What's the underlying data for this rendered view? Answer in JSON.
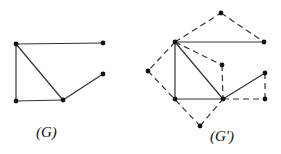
{
  "graphs": [
    {
      "id": "G",
      "label": "(G)",
      "label_pos": [
        48,
        134
      ],
      "nodes": [
        {
          "id": "A",
          "x": 16,
          "y": 44
        },
        {
          "id": "B",
          "x": 103,
          "y": 43
        },
        {
          "id": "C",
          "x": 103,
          "y": 74
        },
        {
          "id": "D",
          "x": 16,
          "y": 101
        },
        {
          "id": "E",
          "x": 63,
          "y": 100
        }
      ],
      "edges": [
        {
          "from": "A",
          "to": "B",
          "style": "solid"
        },
        {
          "from": "A",
          "to": "D",
          "style": "solid"
        },
        {
          "from": "A",
          "to": "E",
          "style": "solid"
        },
        {
          "from": "D",
          "to": "E",
          "style": "solid"
        },
        {
          "from": "E",
          "to": "C",
          "style": "solid"
        }
      ]
    },
    {
      "id": "G'",
      "label": "(G')",
      "label_pos": [
        222,
        138
      ],
      "nodes": [
        {
          "id": "P",
          "x": 221,
          "y": 13
        },
        {
          "id": "A",
          "x": 175,
          "y": 42
        },
        {
          "id": "B",
          "x": 264,
          "y": 42
        },
        {
          "id": "Q",
          "x": 222,
          "y": 65
        },
        {
          "id": "R",
          "x": 148,
          "y": 71
        },
        {
          "id": "C",
          "x": 265,
          "y": 73
        },
        {
          "id": "D",
          "x": 175,
          "y": 99
        },
        {
          "id": "E",
          "x": 223,
          "y": 99
        },
        {
          "id": "S",
          "x": 265,
          "y": 99
        },
        {
          "id": "T",
          "x": 200,
          "y": 126
        }
      ],
      "edges": [
        {
          "from": "A",
          "to": "B",
          "style": "solid"
        },
        {
          "from": "A",
          "to": "D",
          "style": "solid"
        },
        {
          "from": "A",
          "to": "E",
          "style": "solid"
        },
        {
          "from": "D",
          "to": "E",
          "style": "solid"
        },
        {
          "from": "E",
          "to": "C",
          "style": "solid"
        },
        {
          "from": "A",
          "to": "P",
          "style": "dashed"
        },
        {
          "from": "P",
          "to": "B",
          "style": "dashed"
        },
        {
          "from": "A",
          "to": "Q",
          "style": "dashed"
        },
        {
          "from": "Q",
          "to": "E",
          "style": "dashed"
        },
        {
          "from": "A",
          "to": "R",
          "style": "dashed"
        },
        {
          "from": "R",
          "to": "T",
          "style": "dashed"
        },
        {
          "from": "T",
          "to": "E",
          "style": "dashed"
        },
        {
          "from": "C",
          "to": "S",
          "style": "dashed"
        },
        {
          "from": "E",
          "to": "S",
          "style": "dashed"
        }
      ]
    }
  ],
  "colors": {
    "stroke": "#333333",
    "node": "#111111",
    "background": "#ffffff"
  }
}
